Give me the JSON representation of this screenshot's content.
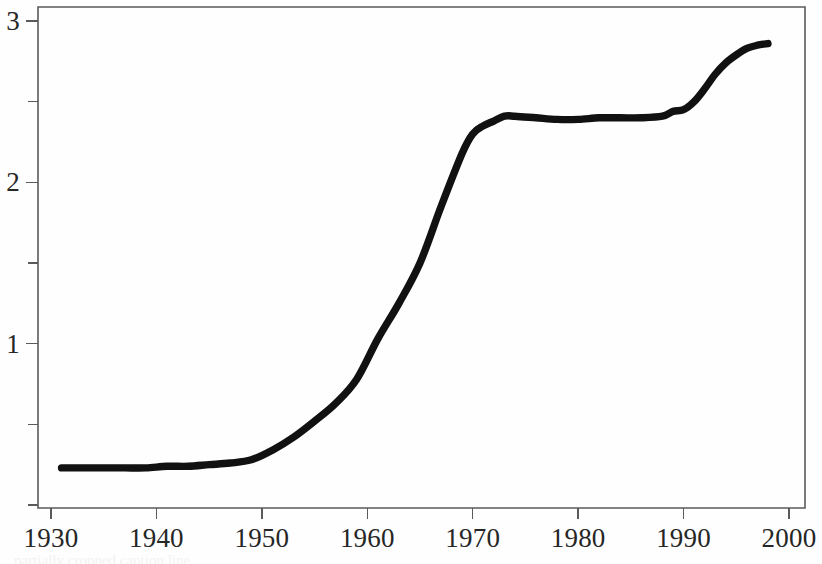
{
  "figure": {
    "background_color": "#fefefe",
    "line_color": "#111111",
    "axis_color": "#5a5a5a",
    "caption_partial": "partially cropped caption line"
  },
  "chart_data": {
    "type": "line",
    "title": "",
    "subtitle": "",
    "xlabel": "",
    "ylabel": "",
    "xlim": [
      1930,
      2000.5
    ],
    "ylim": [
      0,
      3.12
    ],
    "grid": false,
    "legend": null,
    "x_major_ticks": [
      1930,
      1940,
      1950,
      1960,
      1970,
      1980,
      1990,
      2000
    ],
    "x_tick_labels": [
      "1930",
      "1940",
      "1950",
      "1960",
      "1970",
      "1980",
      "1990",
      "2000"
    ],
    "y_major_ticks": [
      1,
      2,
      3
    ],
    "y_tick_labels": [
      "1",
      "2",
      "3"
    ],
    "y_minor_ticks": [
      0,
      0.5,
      1.5,
      2.5
    ],
    "series": [
      {
        "name": "value",
        "x": [
          1931,
          1933,
          1935,
          1937,
          1939,
          1941,
          1943,
          1945,
          1947,
          1949,
          1951,
          1953,
          1955,
          1957,
          1959,
          1961,
          1963,
          1965,
          1967,
          1969,
          1970,
          1971,
          1972,
          1973,
          1974,
          1976,
          1978,
          1980,
          1982,
          1984,
          1986,
          1988,
          1989,
          1990,
          1991,
          1992,
          1993,
          1994,
          1995,
          1996,
          1997,
          1998
        ],
        "y": [
          0.23,
          0.23,
          0.23,
          0.23,
          0.23,
          0.24,
          0.24,
          0.25,
          0.26,
          0.28,
          0.34,
          0.42,
          0.52,
          0.63,
          0.78,
          1.03,
          1.25,
          1.5,
          1.85,
          2.18,
          2.3,
          2.35,
          2.38,
          2.41,
          2.41,
          2.4,
          2.39,
          2.39,
          2.4,
          2.4,
          2.4,
          2.41,
          2.44,
          2.45,
          2.5,
          2.58,
          2.67,
          2.74,
          2.79,
          2.83,
          2.85,
          2.86
        ]
      }
    ]
  }
}
